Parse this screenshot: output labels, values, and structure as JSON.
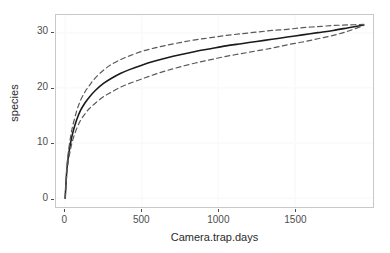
{
  "chart_data": {
    "type": "line",
    "title": "",
    "subtitle": "",
    "xlabel": "Camera.trap.days",
    "ylabel": "species",
    "xlim": [
      -60,
      2010
    ],
    "ylim": [
      -1.6,
      33.2
    ],
    "xticks": [
      0,
      500,
      1000,
      1500
    ],
    "xticklabels": [
      "0",
      "500",
      "1000",
      "1500"
    ],
    "yticks": [
      0,
      10,
      20,
      30
    ],
    "yticklabels": [
      "0",
      "10",
      "20",
      "30"
    ],
    "grid": true,
    "legend": false,
    "legend_position": "none",
    "panel_background": "#ffffff",
    "grid_color": "#fafafa",
    "panel_border_color": "#c8c8c8",
    "series": [
      {
        "name": "species accumulation (observed mean)",
        "style": "solid",
        "color": "#1a1a1a",
        "width": 1.6,
        "x": [
          0,
          10,
          20,
          35,
          50,
          75,
          100,
          130,
          160,
          200,
          250,
          300,
          360,
          420,
          500,
          580,
          660,
          750,
          850,
          950,
          1050,
          1150,
          1250,
          1350,
          1450,
          1550,
          1650,
          1750,
          1850,
          1950
        ],
        "y": [
          0.0,
          4.8,
          7.4,
          10.0,
          11.9,
          14.2,
          15.9,
          17.3,
          18.4,
          19.6,
          20.8,
          21.7,
          22.6,
          23.3,
          24.1,
          24.8,
          25.4,
          26.0,
          26.6,
          27.1,
          27.6,
          28.0,
          28.4,
          28.8,
          29.2,
          29.6,
          30.0,
          30.4,
          30.9,
          31.4
        ]
      },
      {
        "name": "upper confidence limit",
        "style": "dashed",
        "color": "#595959",
        "width": 1.2,
        "x": [
          0,
          10,
          20,
          35,
          50,
          75,
          100,
          130,
          160,
          200,
          250,
          300,
          360,
          420,
          500,
          580,
          660,
          750,
          850,
          950,
          1050,
          1150,
          1250,
          1350,
          1450,
          1550,
          1650,
          1750,
          1850,
          1950
        ],
        "y": [
          0.0,
          5.3,
          8.2,
          11.1,
          13.2,
          15.8,
          17.7,
          19.3,
          20.5,
          21.9,
          23.2,
          24.2,
          25.1,
          25.8,
          26.6,
          27.2,
          27.7,
          28.2,
          28.7,
          29.1,
          29.5,
          29.8,
          30.1,
          30.4,
          30.6,
          30.9,
          31.1,
          31.3,
          31.4,
          31.5
        ]
      },
      {
        "name": "lower confidence limit",
        "style": "dashed",
        "color": "#595959",
        "width": 1.2,
        "x": [
          0,
          10,
          20,
          35,
          50,
          75,
          100,
          130,
          160,
          200,
          250,
          300,
          360,
          420,
          500,
          580,
          660,
          750,
          850,
          950,
          1050,
          1150,
          1250,
          1350,
          1450,
          1550,
          1650,
          1750,
          1850,
          1950
        ],
        "y": [
          0.0,
          4.3,
          6.6,
          8.9,
          10.6,
          12.6,
          14.1,
          15.3,
          16.3,
          17.3,
          18.4,
          19.2,
          20.1,
          20.8,
          21.6,
          22.4,
          23.1,
          23.8,
          24.5,
          25.1,
          25.7,
          26.2,
          26.7,
          27.2,
          27.8,
          28.3,
          28.9,
          29.5,
          30.3,
          31.3
        ]
      }
    ]
  }
}
